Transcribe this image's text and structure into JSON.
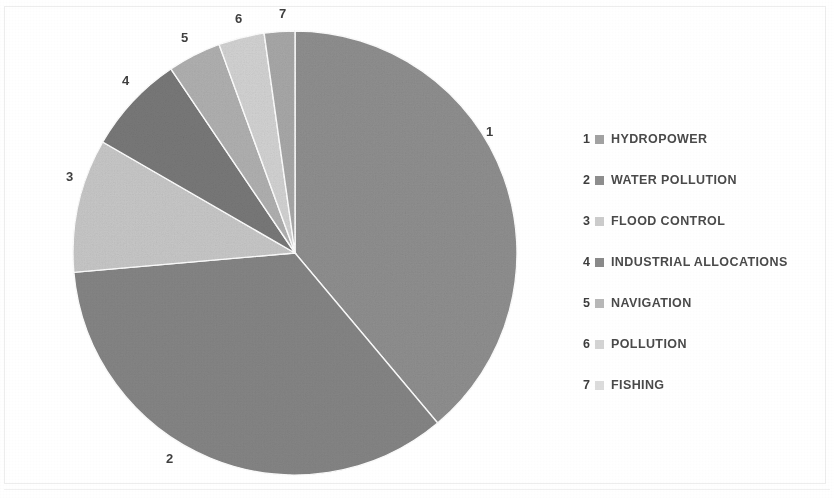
{
  "chart_data": {
    "type": "pie",
    "title": "",
    "subtitle": "",
    "xlabel": "",
    "ylabel": "",
    "legend_position": "right",
    "grid": false,
    "start_angle_deg": 0,
    "direction": "clockwise",
    "categories": [
      "HYDROPOWER",
      "WATER POLLUTION",
      "FLOOD CONTROL",
      "INDUSTRIAL ALLOCATIONS",
      "NAVIGATION",
      "POLLUTION",
      "FISHING"
    ],
    "slice_numbers": [
      "1",
      "2",
      "3",
      "4",
      "5",
      "6",
      "7"
    ],
    "angles_deg": [
      140,
      125,
      35,
      26,
      14,
      12,
      8
    ],
    "values": [
      38.9,
      34.7,
      9.7,
      7.2,
      3.9,
      3.3,
      2.2
    ],
    "colors": [
      "#8f8f8f",
      "#858585",
      "#c7c7c7",
      "#787878",
      "#b0b0b0",
      "#d2d2d2",
      "#a8a8a8"
    ],
    "labels_outside": true
  },
  "chart": {
    "center_x": 295,
    "center_y": 253,
    "radius": 222,
    "slices": [
      {
        "number": "1",
        "name": "HYDROPOWER",
        "angle": 140,
        "color": "#8f8f8f",
        "label_x": 486,
        "label_y": 125
      },
      {
        "number": "2",
        "name": "WATER POLLUTION",
        "angle": 125,
        "color": "#858585",
        "label_x": 166,
        "label_y": 452
      },
      {
        "number": "3",
        "name": "FLOOD CONTROL",
        "angle": 35,
        "color": "#c7c7c7",
        "label_x": 66,
        "label_y": 170
      },
      {
        "number": "4",
        "name": "INDUSTRIAL ALLOCATIONS",
        "angle": 26,
        "color": "#787878",
        "label_x": 122,
        "label_y": 74
      },
      {
        "number": "5",
        "name": "NAVIGATION",
        "angle": 14,
        "color": "#b0b0b0",
        "label_x": 181,
        "label_y": 31
      },
      {
        "number": "6",
        "name": "POLLUTION",
        "angle": 12,
        "color": "#d2d2d2",
        "label_x": 235,
        "label_y": 12
      },
      {
        "number": "7",
        "name": "FISHING",
        "angle": 8,
        "color": "#a8a8a8",
        "label_x": 279,
        "label_y": 7
      }
    ]
  },
  "legend": {
    "items": [
      {
        "index": "1",
        "label": "HYDROPOWER",
        "color": "#a2a2a2"
      },
      {
        "index": "2",
        "label": "WATER POLLUTION",
        "color": "#8e8e8e"
      },
      {
        "index": "3",
        "label": "FLOOD CONTROL",
        "color": "#cccccc"
      },
      {
        "index": "4",
        "label": "INDUSTRIAL ALLOCATIONS",
        "color": "#8a8a8a"
      },
      {
        "index": "5",
        "label": "NAVIGATION",
        "color": "#b8b8b8"
      },
      {
        "index": "6",
        "label": "POLLUTION",
        "color": "#d4d4d4"
      },
      {
        "index": "7",
        "label": "FISHING",
        "color": "#dcdcdc"
      }
    ]
  }
}
